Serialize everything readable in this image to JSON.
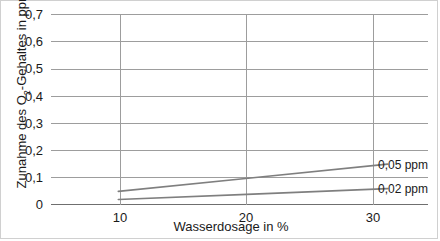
{
  "chart_data": {
    "type": "line",
    "title": "",
    "xlabel": "Wasserdosage in %",
    "ylabel": "Zunahme des O2-Gehaltes in ppm",
    "ylabel_parts": {
      "before": "Zunahme des O",
      "sub": "2",
      "after": "-Gehaltes in ppm"
    },
    "x": [
      10,
      20,
      30
    ],
    "xlim": [
      5,
      33
    ],
    "ylim": [
      0,
      0.7
    ],
    "xticks": [
      10,
      20,
      30
    ],
    "xtick_labels": [
      "10",
      "20",
      "30"
    ],
    "yticks": [
      0,
      0.1,
      0.2,
      0.3,
      0.4,
      0.5,
      0.6,
      0.7
    ],
    "ytick_labels": [
      "0",
      "0,1",
      "0,2",
      "0,3",
      "0,4",
      "0,5",
      "0,6",
      "0,7"
    ],
    "grid": true,
    "legend_position": "right-inline",
    "series": [
      {
        "name": "0,05 ppm",
        "values": [
          0.05,
          0.1,
          0.15
        ],
        "color": "#7f7f7f"
      },
      {
        "name": "0,02 ppm",
        "values": [
          0.02,
          0.04,
          0.06
        ],
        "color": "#7f7f7f"
      }
    ]
  },
  "colors": {
    "gridline": "#9d9d9d",
    "axis": "#6f6f6f",
    "line": "#7f7f7f",
    "text": "#1a1a1a",
    "frame_border": "#d0d0d0",
    "background": "#ffffff"
  }
}
